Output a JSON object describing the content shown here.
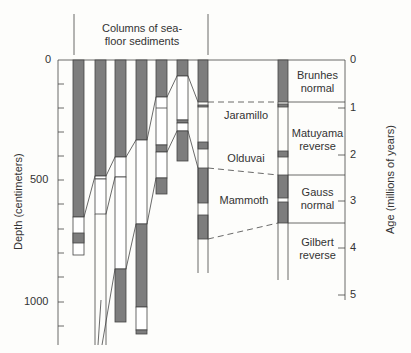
{
  "title": {
    "line1": "Columns of sea-",
    "line2": "floor sediments"
  },
  "left_axis": {
    "label": "Depth (centimeters)",
    "ticks": [
      {
        "v": 0,
        "label": "0"
      },
      {
        "v": 500,
        "label": "500"
      },
      {
        "v": 1000,
        "label": "1000"
      }
    ],
    "minor_step": 100,
    "range": [
      0,
      1150
    ]
  },
  "right_axis": {
    "label": "Age (millions of years)",
    "ticks": [
      {
        "v": 0,
        "label": "0"
      },
      {
        "v": 1,
        "label": "1"
      },
      {
        "v": 2,
        "label": "2"
      },
      {
        "v": 3,
        "label": "3"
      },
      {
        "v": 4,
        "label": "4"
      },
      {
        "v": 5,
        "label": "5"
      }
    ]
  },
  "events": [
    {
      "name": "Jaramillo"
    },
    {
      "name": "Olduvai"
    },
    {
      "name": "Mammoth"
    }
  ],
  "epochs": [
    {
      "line1": "Brunhes",
      "line2": "normal"
    },
    {
      "line1": "Matuyama",
      "line2": "reverse"
    },
    {
      "line1": "Gauss",
      "line2": "normal"
    },
    {
      "line1": "Gilbert",
      "line2": "reverse"
    }
  ],
  "colors": {
    "grey": "#7d7d7d",
    "line": "#444444",
    "bg": "#fdfdfb"
  }
}
